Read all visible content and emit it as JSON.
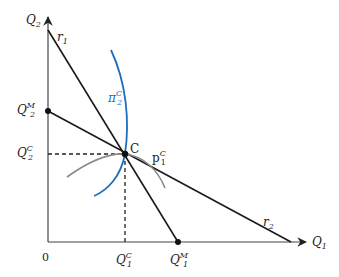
{
  "diagram": {
    "axes": {
      "y_label": {
        "base": "Q",
        "sub": "2"
      },
      "x_label": {
        "base": "Q",
        "sub": "1"
      },
      "origin_label": "0"
    },
    "lines": [
      {
        "name": "r1",
        "label": {
          "base": "r",
          "sub": "1"
        }
      },
      {
        "name": "r2",
        "label": {
          "base": "r",
          "sub": "2"
        }
      }
    ],
    "curves": [
      {
        "name": "pi2C",
        "label": {
          "base": "π",
          "sub": "2",
          "sup": "C"
        },
        "color": "#1a6fb8"
      },
      {
        "name": "p1C",
        "label": {
          "base": "p",
          "sub": "1",
          "sup": "C"
        },
        "color": "#888888"
      }
    ],
    "points": {
      "C": {
        "label": "C"
      },
      "Q2M": {
        "label": {
          "base": "Q",
          "sub": "2",
          "sup": "M"
        }
      },
      "Q1M": {
        "label": {
          "base": "Q",
          "sub": "1",
          "sup": "M"
        }
      }
    },
    "ticks": {
      "Q2C": {
        "base": "Q",
        "sub": "2",
        "sup": "C"
      },
      "Q1C": {
        "base": "Q",
        "sub": "1",
        "sup": "C"
      }
    },
    "colors": {
      "axis": "#333333",
      "line": "#1a1a1a",
      "blue_curve": "#1a6fb8",
      "gray_curve": "#8a8a8a"
    }
  }
}
